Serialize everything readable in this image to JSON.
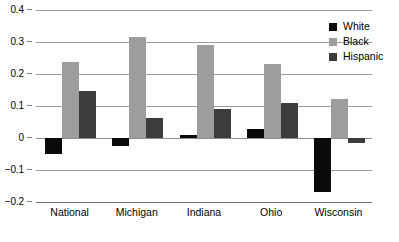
{
  "chart_data": {
    "type": "bar",
    "title": "",
    "subtitle": "",
    "xlabel": "",
    "ylabel": "",
    "categories": [
      "National",
      "Michigan",
      "Indiana",
      "Ohio",
      "Wisconsin"
    ],
    "series": [
      {
        "name": "White",
        "color": "#0a0a0a",
        "values": [
          -0.05,
          -0.025,
          0.01,
          0.027,
          -0.168
        ]
      },
      {
        "name": "Black",
        "color": "#9d9d9d",
        "values": [
          0.237,
          0.317,
          0.292,
          0.232,
          0.122
        ]
      },
      {
        "name": "Hispanic",
        "color": "#3c3c3c",
        "values": [
          0.148,
          0.062,
          0.09,
          0.108,
          -0.017
        ]
      }
    ],
    "ylim": [
      -0.2,
      0.4
    ],
    "yticks": [
      0.4,
      0.3,
      0.2,
      0.1,
      0,
      -0.1,
      -0.2
    ],
    "ytick_labels": [
      "0.4",
      "0.3",
      "0.2",
      "0.1",
      "0",
      "−0.1",
      "−0.2"
    ],
    "grid": true,
    "legend_position": "top-right",
    "legend_entries": [
      "White",
      "Black",
      "Hispanic"
    ]
  }
}
